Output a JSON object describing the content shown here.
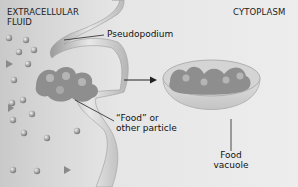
{
  "diagram": {
    "regions": {
      "left": {
        "line1": "Extracellular",
        "line2": "fluid"
      },
      "right": "Cytoplasm"
    },
    "labels": {
      "pseudopodium": "Pseudopodium",
      "food_line1": "“Food” or",
      "food_line2": "other particle",
      "vacuole_line1": "Food",
      "vacuole_line2": "vacuole"
    },
    "colors": {
      "extracellular_bg": "#cfcfcf",
      "cytoplasm_bg": "#ececec",
      "membrane": "#bdbdbd",
      "particle": "#7d7d7d",
      "leader_line": "#222222"
    }
  }
}
